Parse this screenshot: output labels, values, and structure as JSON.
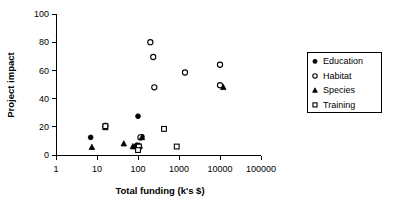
{
  "chart_data": {
    "type": "scatter",
    "title": "",
    "xlabel": "Total funding (k's $)",
    "ylabel": "Project impact",
    "xscale": "log",
    "yscale": "linear",
    "xlim": [
      1,
      100000
    ],
    "ylim": [
      0,
      100
    ],
    "xticks": [
      1,
      10,
      100,
      1000,
      10000,
      100000
    ],
    "xticklabels": [
      "1",
      "10",
      "100",
      "1000",
      "10000",
      "100000"
    ],
    "yticks": [
      0,
      20,
      40,
      60,
      80,
      100
    ],
    "yticklabels": [
      "0",
      "20",
      "40",
      "60",
      "80",
      "100"
    ],
    "grid": false,
    "legend_position": "right-outside",
    "series": [
      {
        "name": "Education",
        "marker": "filled-circle",
        "color": "#000000",
        "points": [
          {
            "x": 7.0,
            "y": 12.5
          },
          {
            "x": 16.0,
            "y": 21.0
          },
          {
            "x": 95.0,
            "y": 7.0
          },
          {
            "x": 100.0,
            "y": 27.5
          },
          {
            "x": 125.0,
            "y": 13.0
          }
        ]
      },
      {
        "name": "Habitat",
        "marker": "open-circle",
        "color": "#000000",
        "points": [
          {
            "x": 200.0,
            "y": 80.0
          },
          {
            "x": 235.0,
            "y": 69.5
          },
          {
            "x": 250.0,
            "y": 48.0
          },
          {
            "x": 1400.0,
            "y": 58.5
          },
          {
            "x": 10000.0,
            "y": 64.0
          },
          {
            "x": 10000.0,
            "y": 49.5
          },
          {
            "x": 115.0,
            "y": 12.5
          },
          {
            "x": 16.0,
            "y": 20.5
          }
        ]
      },
      {
        "name": "Species",
        "marker": "filled-triangle",
        "color": "#000000",
        "points": [
          {
            "x": 7.5,
            "y": 5.5
          },
          {
            "x": 16.0,
            "y": 19.5
          },
          {
            "x": 45.0,
            "y": 8.0
          },
          {
            "x": 75.0,
            "y": 6.0
          },
          {
            "x": 85.0,
            "y": 6.0
          },
          {
            "x": 110.0,
            "y": 6.5
          },
          {
            "x": 125.0,
            "y": 12.5
          },
          {
            "x": 12000.0,
            "y": 48.0
          }
        ]
      },
      {
        "name": "Training",
        "marker": "open-square",
        "color": "#000000",
        "points": [
          {
            "x": 16.0,
            "y": 20.5
          },
          {
            "x": 105.0,
            "y": 6.0
          },
          {
            "x": 100.0,
            "y": 3.5
          },
          {
            "x": 430.0,
            "y": 18.5
          },
          {
            "x": 880.0,
            "y": 6.0
          }
        ]
      }
    ]
  },
  "legend": {
    "items": [
      {
        "label": "Education",
        "marker": "filled-circle"
      },
      {
        "label": "Habitat",
        "marker": "open-circle"
      },
      {
        "label": "Species",
        "marker": "filled-triangle"
      },
      {
        "label": "Training",
        "marker": "open-square"
      }
    ]
  }
}
